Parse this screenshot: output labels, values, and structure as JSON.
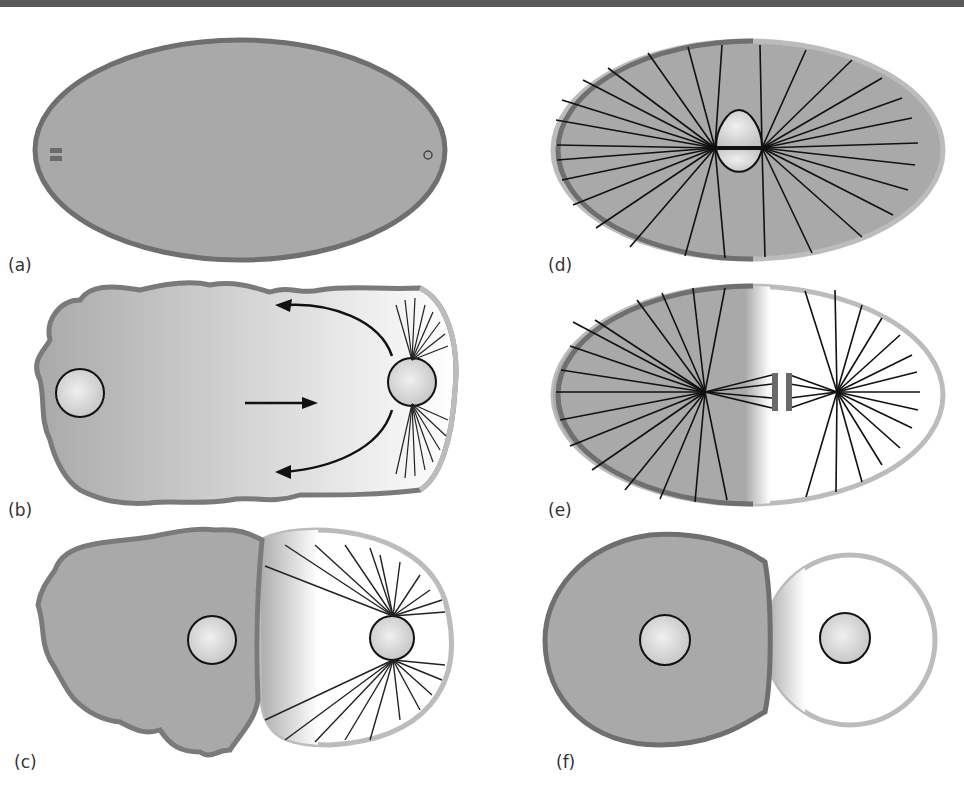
{
  "figure": {
    "panels": [
      {
        "id": "a",
        "label": "(a)",
        "description": "Oval cell, uniform gray cytoplasm, two small bars at left pole and small circle at right pole"
      },
      {
        "id": "b",
        "label": "(b)",
        "description": "Irregular cell, nucleus at left, second nucleus at right with asters; arrows show cortical flow"
      },
      {
        "id": "c",
        "label": "(c)",
        "description": "Cell with gray ruffled anterior containing nucleus and clear posterior with spindle asters"
      },
      {
        "id": "d",
        "label": "(d)",
        "description": "Oval cell with two pronuclei at center and radiating astral microtubules"
      },
      {
        "id": "e",
        "label": "(e)",
        "description": "Oval cell with spindle; gray anterior half, white posterior half; asymmetric spindle"
      },
      {
        "id": "f",
        "label": "(f)",
        "description": "Two-cell stage: larger gray anterior cell and smaller clear posterior cell, each with nucleus"
      }
    ],
    "colors": {
      "cytoplasm_gray": "#a9a9a9",
      "outline_dark": "#6f6f6f",
      "outline_light": "#b8b8b8",
      "nucleus_fill": "#dcdcdc",
      "line": "#1a1a1a",
      "topbar": "#5a5a5a"
    }
  }
}
